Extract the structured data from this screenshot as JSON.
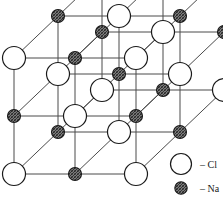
{
  "figure": {
    "name": "sodium-chloride-crystal-lattice",
    "projection": "oblique",
    "grid": {
      "nx": 3,
      "ny": 3,
      "nz": 3
    },
    "colors": {
      "background": "#ffffff",
      "bond_line": "#4a4a4a",
      "atom_outline": "#1a1a1a",
      "chlorine_fill": "#ffffff",
      "sodium_fill": "#9a9a9a",
      "sodium_hatch": "#2b2b2b",
      "text": "#1a1a1a"
    },
    "geometry": {
      "origin_x": 14,
      "origin_y": 174,
      "step_x": 61,
      "step_y": -58,
      "depth_dx": 44,
      "depth_dy": -42,
      "chlorine_radius": 11.5,
      "sodium_radius": 6.5
    }
  },
  "atoms": {
    "chlorine": {
      "symbol": "Cl",
      "role": "anion",
      "marker": "open-circle",
      "radius": 11.5
    },
    "sodium": {
      "symbol": "Na",
      "role": "cation",
      "marker": "hatched-circle",
      "radius": 6.5
    }
  },
  "legend": {
    "position": "bottom-right",
    "items": [
      {
        "key": "chlorine",
        "marker": "open-circle",
        "dash": "–",
        "label": "Cl",
        "text": "– Cl"
      },
      {
        "key": "sodium",
        "marker": "hatched-circle",
        "dash": "–",
        "label": "Na",
        "text": "– Na"
      }
    ]
  },
  "chart_data": {
    "type": "diagram",
    "title": "",
    "subtitle": "",
    "legend_position": "bottom-right",
    "series": [
      {
        "name": "Cl",
        "marker": "open-circle",
        "count": 14
      },
      {
        "name": "Na",
        "marker": "hatched-circle",
        "count": 13
      }
    ]
  }
}
